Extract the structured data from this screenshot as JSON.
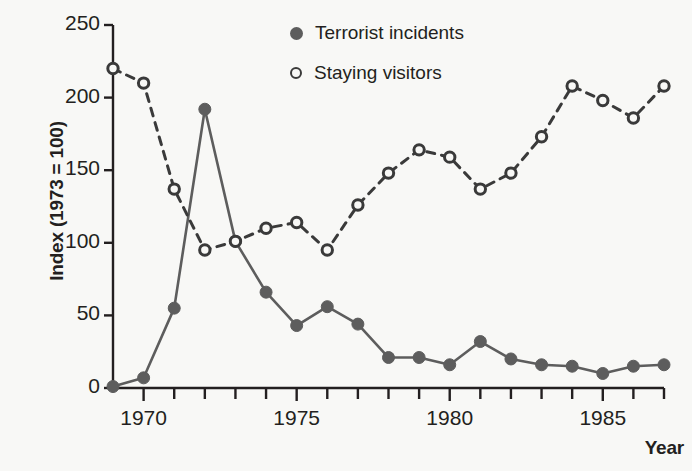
{
  "chart_data": {
    "type": "line",
    "title": "",
    "xlabel": "Year",
    "ylabel": "Index (1973 = 100)",
    "x": [
      1969,
      1970,
      1971,
      1972,
      1973,
      1974,
      1975,
      1976,
      1977,
      1978,
      1979,
      1980,
      1981,
      1982,
      1983,
      1984,
      1985,
      1986,
      1987
    ],
    "xlim": [
      1969,
      1987
    ],
    "ylim": [
      0,
      250
    ],
    "xticks": [
      1970,
      1975,
      1980,
      1985
    ],
    "xtick_labels": [
      "1970",
      "1975",
      "1980",
      "1985"
    ],
    "xticks_minor_every": 1,
    "yticks": [
      0,
      50,
      100,
      150,
      200,
      250
    ],
    "ytick_labels": [
      "0",
      "50",
      "100",
      "150",
      "200",
      "250"
    ],
    "grid": false,
    "legend_position": "top-center-right",
    "series": [
      {
        "name": "Terrorist incidents",
        "marker": "filled-circle",
        "linestyle": "solid",
        "color": "#5d5d5d",
        "values": [
          1,
          7,
          55,
          192,
          101,
          66,
          43,
          56,
          44,
          21,
          21,
          16,
          32,
          20,
          16,
          15,
          10,
          15,
          16
        ]
      },
      {
        "name": "Staying visitors",
        "marker": "open-circle",
        "linestyle": "dashed",
        "color": "#3a3a3a",
        "values": [
          220,
          210,
          137,
          95,
          101,
          110,
          114,
          95,
          126,
          148,
          164,
          159,
          137,
          148,
          173,
          208,
          198,
          186,
          208
        ]
      }
    ]
  },
  "axes": {
    "y_title": "Index (1973 = 100)",
    "x_title": "Year"
  },
  "legend": {
    "items": [
      {
        "label": "Terrorist incidents",
        "marker": "filled-circle"
      },
      {
        "label": "Staying visitors",
        "marker": "open-circle"
      }
    ]
  },
  "colors": {
    "background": "#f8f8f6",
    "axis": "#231f20",
    "series_filled": "#5d5d5d",
    "series_open": "#3a3a3a"
  }
}
